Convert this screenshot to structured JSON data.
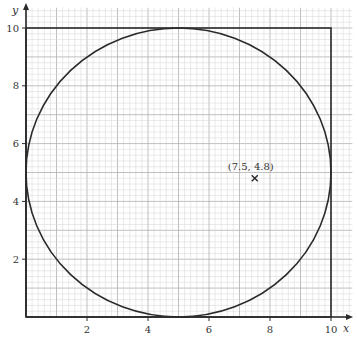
{
  "chart_data": {
    "type": "scatter",
    "title": "",
    "xlabel": "x",
    "ylabel": "y",
    "xlim": [
      0,
      10.7
    ],
    "ylim": [
      0,
      10.7
    ],
    "grid": true,
    "grid_minor_step": 0.2,
    "grid_major_step": 1,
    "xticks": [
      2,
      4,
      6,
      8,
      10
    ],
    "yticks": [
      2,
      4,
      6,
      8,
      10
    ],
    "xtick_labels": [
      "2",
      "4",
      "6",
      "8",
      "10"
    ],
    "ytick_labels": [
      "2",
      "4",
      "6",
      "8",
      "10"
    ],
    "shapes": {
      "square": {
        "x0": 0,
        "y0": 0,
        "x1": 10,
        "y1": 10
      },
      "circle": {
        "cx": 5,
        "cy": 5,
        "r": 5
      }
    },
    "points": [
      {
        "x": 7.5,
        "y": 4.8,
        "marker": "cross",
        "label": "(7.5, 4.8)"
      }
    ],
    "colors": {
      "grid_minor": "#d4d4d4",
      "grid_major": "#b0b0b0",
      "lines": "#2a2a2a"
    }
  }
}
